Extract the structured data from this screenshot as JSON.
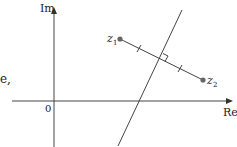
{
  "diagram": {
    "axes": {
      "x_label": "Re",
      "y_label": "Im",
      "origin_label": "0"
    },
    "points": [
      {
        "name": "z",
        "subscript": "1"
      },
      {
        "name": "z",
        "subscript": "2"
      }
    ],
    "partial_text": "e,",
    "colors": {
      "line": "#333333",
      "point": "#666666"
    }
  }
}
